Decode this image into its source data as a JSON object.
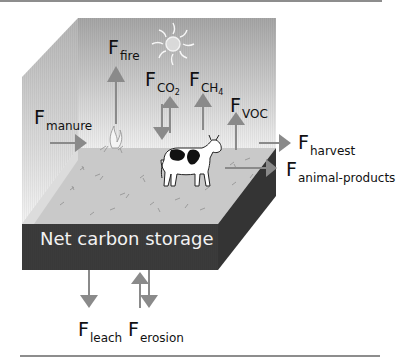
{
  "figure": {
    "storage_label": "Net carbon storage",
    "colors": {
      "arrow": "#8a8a8a",
      "floor": "#c8c8c8",
      "soil_block": "#3c3c3c",
      "rule": "#8d8d8d",
      "sky_top": "#a9a9a9",
      "sky_bottom": "#ececec"
    },
    "fluxes": {
      "fire": {
        "main": "F",
        "sub": "fire",
        "direction": "up"
      },
      "co2": {
        "main": "F",
        "sub": "CO",
        "subsub": "2",
        "direction": "bidirectional"
      },
      "ch4": {
        "main": "F",
        "sub": "CH",
        "subsub": "4",
        "direction": "up"
      },
      "voc": {
        "main": "F",
        "sub": "VOC",
        "direction": "up"
      },
      "manure": {
        "main": "F",
        "sub": "manure",
        "direction": "in"
      },
      "harvest": {
        "main": "F",
        "sub": "harvest",
        "direction": "out"
      },
      "animal_products": {
        "main": "F",
        "sub": "animal-products",
        "direction": "out"
      },
      "leach": {
        "main": "F",
        "sub": "leach",
        "direction": "down"
      },
      "erosion": {
        "main": "F",
        "sub": "erosion",
        "direction": "bidirectional"
      }
    },
    "icons": [
      "sun-icon",
      "fire-icon",
      "cow-icon",
      "grass-icon"
    ]
  }
}
